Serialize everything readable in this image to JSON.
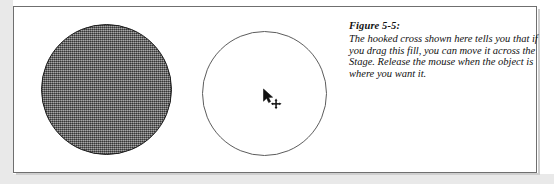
{
  "figure": {
    "label": "Figure 5-5:",
    "caption_lines": [
      "The hooked cross shown here tells you that if",
      "you drag this fill, you can move it across the",
      "Stage. Release the mouse when the object is",
      "where you want it."
    ]
  },
  "shapes": [
    {
      "name": "filled-circle",
      "fill": "#6e6e6e",
      "fill_style": "halftone-gray",
      "stroke": "#1b1b1b"
    },
    {
      "name": "outline-circle",
      "fill": "none",
      "stroke": "#5c5c5c"
    }
  ],
  "cursor": {
    "icon": "move-arrow-cursor",
    "pointer": "arrow-pointer-icon",
    "badge": "four-way-move-icon"
  },
  "frame": {
    "border_color": "#6f6f6f",
    "background": "#ffffff",
    "margin_color": "#e9e9e9"
  }
}
